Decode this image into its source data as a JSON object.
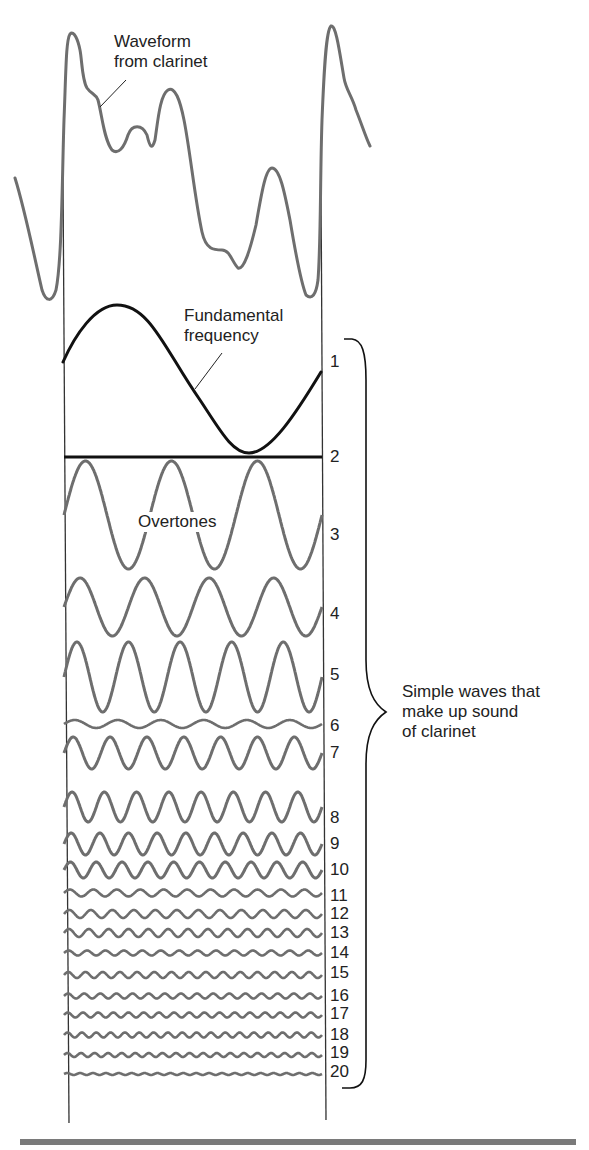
{
  "labels": {
    "waveform_line1": "Waveform",
    "waveform_line2": "from clarinet",
    "fundamental_line1": "Fundamental",
    "fundamental_line2": "frequency",
    "overtones": "Overtones",
    "summary_line1": "Simple waves that",
    "summary_line2": "make up sound",
    "summary_line3": "of clarinet"
  },
  "harmonics": [
    {
      "n": "1",
      "label_y": 362
    },
    {
      "n": "2",
      "label_y": 457
    },
    {
      "n": "3",
      "label_y": 535
    },
    {
      "n": "4",
      "label_y": 614
    },
    {
      "n": "5",
      "label_y": 675
    },
    {
      "n": "6",
      "label_y": 726
    },
    {
      "n": "7",
      "label_y": 753
    },
    {
      "n": "8",
      "label_y": 818
    },
    {
      "n": "9",
      "label_y": 844
    },
    {
      "n": "10",
      "label_y": 870
    },
    {
      "n": "11",
      "label_y": 896
    },
    {
      "n": "12",
      "label_y": 914
    },
    {
      "n": "13",
      "label_y": 933
    },
    {
      "n": "14",
      "label_y": 953
    },
    {
      "n": "15",
      "label_y": 973
    },
    {
      "n": "16",
      "label_y": 996
    },
    {
      "n": "17",
      "label_y": 1014
    },
    {
      "n": "18",
      "label_y": 1035
    },
    {
      "n": "19",
      "label_y": 1053
    },
    {
      "n": "20",
      "label_y": 1072
    }
  ],
  "waves": [
    {
      "n": 2,
      "cycles": 0,
      "center": 457,
      "amp": 0,
      "phase": 0
    },
    {
      "n": 3,
      "cycles": 3,
      "center": 515,
      "amp": 54,
      "phase": 0
    },
    {
      "n": 4,
      "cycles": 4,
      "center": 607,
      "amp": 29,
      "phase": 0
    },
    {
      "n": 5,
      "cycles": 5,
      "center": 677,
      "amp": 35,
      "phase": 0
    },
    {
      "n": 6,
      "cycles": 6,
      "center": 724,
      "amp": 4,
      "phase": 0
    },
    {
      "n": 7,
      "cycles": 7,
      "center": 753,
      "amp": 16,
      "phase": 0
    },
    {
      "n": 8,
      "cycles": 8,
      "center": 807,
      "amp": 15,
      "phase": 0
    },
    {
      "n": 9,
      "cycles": 9,
      "center": 844,
      "amp": 11,
      "phase": 0
    },
    {
      "n": 10,
      "cycles": 10,
      "center": 870,
      "amp": 8,
      "phase": 0
    },
    {
      "n": 11,
      "cycles": 11,
      "center": 893,
      "amp": 3.5,
      "phase": 0
    },
    {
      "n": 12,
      "cycles": 12,
      "center": 914,
      "amp": 4,
      "phase": 0
    },
    {
      "n": 13,
      "cycles": 13,
      "center": 933,
      "amp": 4,
      "phase": 0
    },
    {
      "n": 14,
      "cycles": 14,
      "center": 953,
      "amp": 2.5,
      "phase": 0
    },
    {
      "n": 15,
      "cycles": 15,
      "center": 975,
      "amp": 3,
      "phase": 0
    },
    {
      "n": 16,
      "cycles": 16,
      "center": 996,
      "amp": 2.5,
      "phase": 0
    },
    {
      "n": 17,
      "cycles": 17,
      "center": 1015,
      "amp": 2.5,
      "phase": 0
    },
    {
      "n": 18,
      "cycles": 18,
      "center": 1035,
      "amp": 2.5,
      "phase": 0
    },
    {
      "n": 19,
      "cycles": 19,
      "center": 1055,
      "amp": 2,
      "phase": 0
    },
    {
      "n": 20,
      "cycles": 20,
      "center": 1074,
      "amp": 1,
      "phase": 0
    }
  ],
  "colors": {
    "wave": "#6e6e6e",
    "fundamental": "#111111",
    "frame": "#333333",
    "rule": "#7a7a7a"
  }
}
